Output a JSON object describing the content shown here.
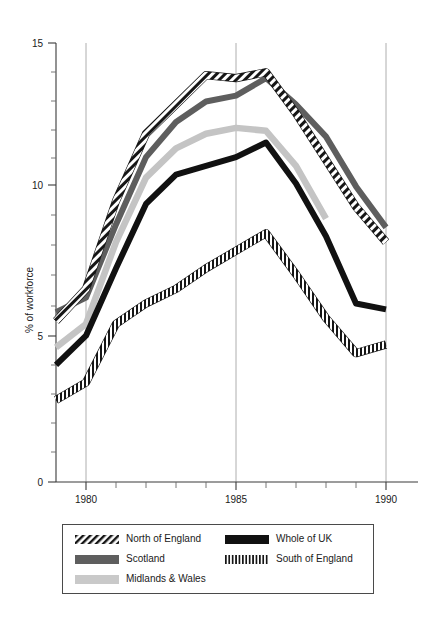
{
  "chart_data": {
    "type": "line",
    "title": "",
    "xlabel": "",
    "ylabel": "% of workforce",
    "xlim": [
      1979,
      1990
    ],
    "ylim": [
      0,
      15
    ],
    "yticks": [
      0,
      5,
      10,
      15
    ],
    "ytick_labels": [
      "0",
      "5",
      "10",
      "15"
    ],
    "yminor_step": 1,
    "xticks": [
      1980,
      1985,
      1990
    ],
    "xtick_labels": [
      "1980",
      "1985",
      "1990"
    ],
    "xminor_step": 1,
    "grid": "vertical gridlines at 1980, 1985, 1990",
    "legend_position": "below plot, boxed, two columns",
    "x": [
      1979,
      1980,
      1981,
      1982,
      1983,
      1984,
      1985,
      1986,
      1987,
      1988,
      1989,
      1990
    ],
    "series": [
      {
        "name": "North of England",
        "pattern": "diagonal-hatch",
        "color": "#1a1a1a",
        "values": [
          5.5,
          6.6,
          9.6,
          11.9,
          12.9,
          13.9,
          13.8,
          14.0,
          12.6,
          11.0,
          9.4,
          8.2
        ]
      },
      {
        "name": "Scotland",
        "pattern": "solid",
        "color": "#5e5e5e",
        "values": [
          5.8,
          6.3,
          8.8,
          11.1,
          12.3,
          13.0,
          13.2,
          13.8,
          12.9,
          11.8,
          10.1,
          8.7
        ]
      },
      {
        "name": "Midlands & Wales",
        "pattern": "solid",
        "color": "#c4c4c4",
        "values": [
          4.6,
          5.4,
          8.2,
          10.4,
          11.4,
          11.9,
          12.1,
          12.0,
          10.8,
          9.0,
          null,
          null
        ]
      },
      {
        "name": "Whole of UK",
        "pattern": "solid",
        "color": "#111111",
        "values": [
          4.0,
          5.0,
          7.3,
          9.5,
          10.5,
          10.8,
          11.1,
          11.6,
          10.2,
          8.4,
          6.1,
          5.9
        ]
      },
      {
        "name": "South of England",
        "pattern": "vertical-hatch",
        "color": "#1a1a1a",
        "values": [
          2.8,
          3.4,
          5.4,
          6.1,
          6.6,
          7.3,
          7.9,
          8.5,
          7.1,
          5.6,
          4.4,
          4.7
        ]
      }
    ]
  },
  "legend": {
    "items": [
      {
        "label": "North of England",
        "swatch": "diagonal-hatch-swatch"
      },
      {
        "label": "Whole of UK",
        "swatch": "solid-black-swatch"
      },
      {
        "label": "Scotland",
        "swatch": "solid-darkgray-swatch"
      },
      {
        "label": "South of England",
        "swatch": "vertical-hatch-swatch"
      },
      {
        "label": "Midlands & Wales",
        "swatch": "solid-lightgray-swatch"
      }
    ]
  }
}
